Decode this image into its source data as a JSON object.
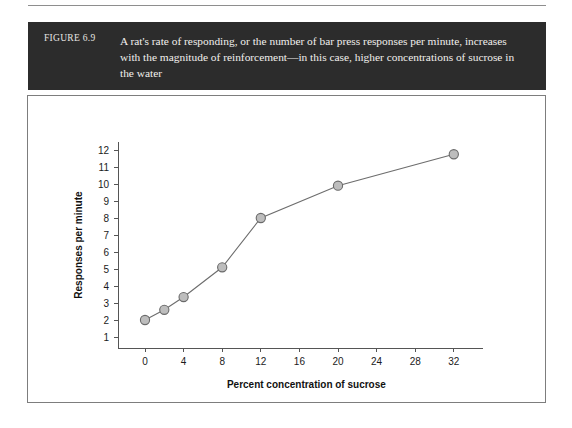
{
  "figure": {
    "number_label": "FIGURE 6.9",
    "caption": "A rat's rate of responding, or the number of bar press responses per minute, increases with the magnitude of reinforcement—in this case, higher concentrations of sucrose in the water"
  },
  "colors": {
    "caption_band": "#2c2c2c",
    "caption_text": "#f1efec",
    "frame_border": "#7d7d7d",
    "marker_fill": "#bdbdbd",
    "marker_stroke": "#6a6a6a",
    "line": "#6d6d6d",
    "axis": "#555555",
    "page_background": "#ffffff"
  },
  "chart_data": {
    "type": "line",
    "title": "",
    "xlabel": "Percent concentration of sucrose",
    "ylabel": "Responses per minute",
    "x": [
      0,
      2,
      4,
      8,
      12,
      20,
      32
    ],
    "values": [
      2.0,
      2.6,
      3.35,
      5.1,
      8.0,
      9.9,
      11.75
    ],
    "series": [
      {
        "name": "Responses per minute",
        "x": [
          0,
          2,
          4,
          8,
          12,
          20,
          32
        ],
        "values": [
          2.0,
          2.6,
          3.35,
          5.1,
          8.0,
          9.9,
          11.75
        ]
      }
    ],
    "xticks": [
      0,
      4,
      8,
      12,
      16,
      20,
      24,
      28,
      32
    ],
    "xtick_labels": [
      "0",
      "4",
      "8",
      "12",
      "16",
      "20",
      "24",
      "28",
      "32"
    ],
    "yticks": [
      1,
      2,
      3,
      4,
      5,
      6,
      7,
      8,
      9,
      10,
      11,
      12
    ],
    "ytick_labels": [
      "1",
      "2",
      "3",
      "4",
      "5",
      "6",
      "7",
      "8",
      "9",
      "10",
      "11",
      "12"
    ],
    "xlim": [
      -2,
      35
    ],
    "ylim": [
      0,
      12.9
    ],
    "grid": false,
    "legend": false,
    "marker": "circle"
  }
}
